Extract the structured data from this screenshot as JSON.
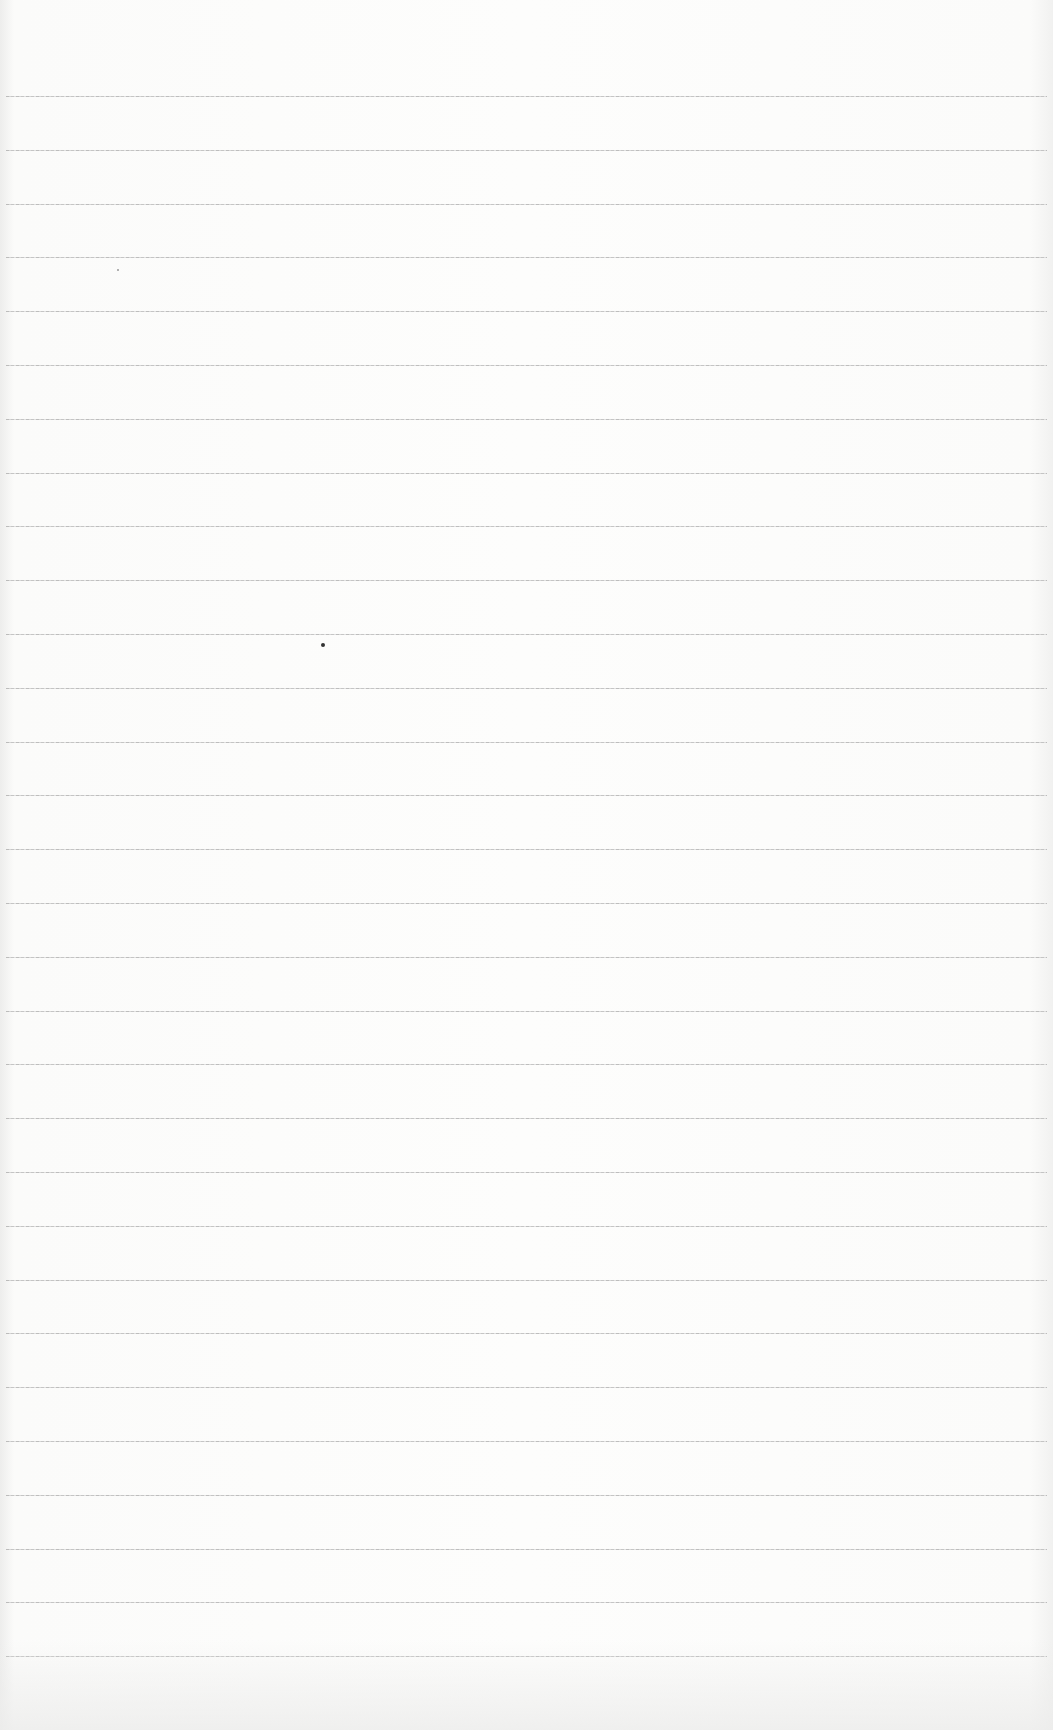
{
  "document": {
    "type": "ruled-paper",
    "background_color": "#fbfbfa",
    "rule_color": "#b5b5b5",
    "rule_count": 30,
    "first_rule_y": 96,
    "rule_spacing": 53.8,
    "text_content": ""
  }
}
